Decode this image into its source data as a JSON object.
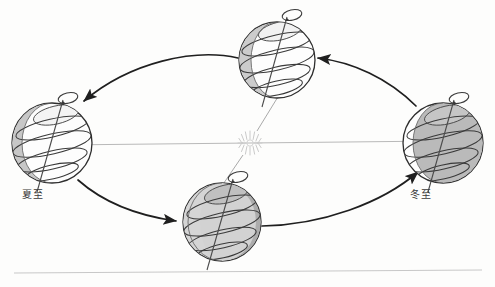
{
  "figure": {
    "background_color": "#fdfdfc",
    "width": 495,
    "height": 287
  },
  "sun": {
    "name": "sun",
    "cx": 250,
    "cy": 143,
    "ray_count": 16,
    "inner_radius": 3.5,
    "outer_radius": 12,
    "color": "#cfcfcf"
  },
  "orbit": {
    "type": "ellipse",
    "cx": 248,
    "cy": 140,
    "rx": 196,
    "ry": 78,
    "direction": "counterclockwise",
    "stroke": "#2b2b2b"
  },
  "axis_line": {
    "label": "sun-earth axis line",
    "x1": 60,
    "y1": 145,
    "x2": 440,
    "y2": 141,
    "color": "#b8b8b8"
  },
  "baseline_rule": {
    "x1": 14,
    "y1": 273,
    "x2": 482,
    "y2": 270,
    "color": "#c8c8c8"
  },
  "earths": [
    {
      "id": "earth-top",
      "position_label": "top",
      "cx": 277,
      "cy": 60,
      "r": 38,
      "tilt_deg": -23.5,
      "lit_side": "right",
      "shade_fill": "#c9c9c9",
      "body_fill": "#fcfcfc",
      "pole_visible": "north",
      "has_rotation_arrow": true,
      "season_label": ""
    },
    {
      "id": "earth-left",
      "position_label": "left",
      "cx": 52,
      "cy": 143,
      "r": 40,
      "tilt_deg": -23.5,
      "lit_side": "right",
      "shade_fill": "#c4c4c4",
      "body_fill": "#fdfdfd",
      "pole_visible": "north",
      "has_rotation_arrow": true,
      "season_label": "夏至"
    },
    {
      "id": "earth-bottom",
      "position_label": "bottom",
      "cx": 222,
      "cy": 222,
      "r": 39,
      "tilt_deg": -23.5,
      "lit_side": "upper-left",
      "shade_fill": "#a9a9a9",
      "body_fill": "#c9c9c9",
      "pole_visible": "north",
      "has_rotation_arrow": true,
      "season_label": ""
    },
    {
      "id": "earth-right",
      "position_label": "right",
      "cx": 443,
      "cy": 143,
      "r": 40,
      "tilt_deg": -23.5,
      "lit_side": "left",
      "shade_fill": "#b6b6b6",
      "body_fill": "#fcfcfc",
      "pole_visible": "north",
      "has_rotation_arrow": true,
      "season_label": "冬至"
    }
  ],
  "labels": {
    "summer_solstice": "夏至",
    "winter_solstice": "冬至"
  },
  "orbit_arrows": [
    {
      "id": "arrow-top-to-left",
      "from": "earth-top",
      "to": "earth-left",
      "direction": "left-down"
    },
    {
      "id": "arrow-left-to-bottom",
      "from": "earth-left",
      "to": "earth-bottom",
      "direction": "right-down"
    },
    {
      "id": "arrow-bottom-to-right",
      "from": "earth-bottom",
      "to": "earth-right",
      "direction": "right-up"
    },
    {
      "id": "arrow-right-to-top",
      "from": "earth-right",
      "to": "earth-top",
      "direction": "left-up"
    }
  ],
  "sun_rays": [
    {
      "id": "ray-to-top",
      "x1": 257,
      "y1": 131,
      "x2": 283,
      "y2": 88
    },
    {
      "id": "ray-to-bottom",
      "x1": 243,
      "y1": 155,
      "x2": 216,
      "y2": 196
    }
  ]
}
